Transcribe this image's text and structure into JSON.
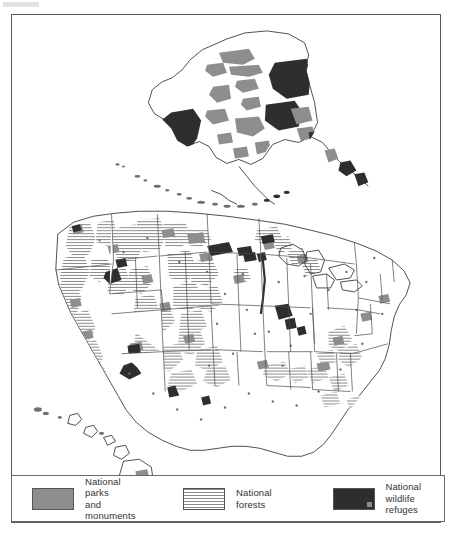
{
  "figure": {
    "type": "thematic-map",
    "regions_shown": [
      "Contiguous United States",
      "Alaska",
      "Hawaii",
      "Aleutian Islands"
    ]
  },
  "legend": {
    "items": [
      {
        "id": "parks",
        "label": "National parks\nand monuments",
        "swatch_style": "solid-gray",
        "color": "#8e8e8e"
      },
      {
        "id": "forests",
        "label": "National forests",
        "swatch_style": "horizontal-stripes",
        "color": "#8a8a8a"
      },
      {
        "id": "refuges",
        "label": "National wildlife\nrefuges",
        "swatch_style": "solid-dark",
        "color": "#2e2e2e"
      }
    ]
  },
  "colors": {
    "frame": "#5a5a5a",
    "background": "#ffffff",
    "state_border": "#4a4a4a",
    "coastline": "#3c3c3c"
  }
}
